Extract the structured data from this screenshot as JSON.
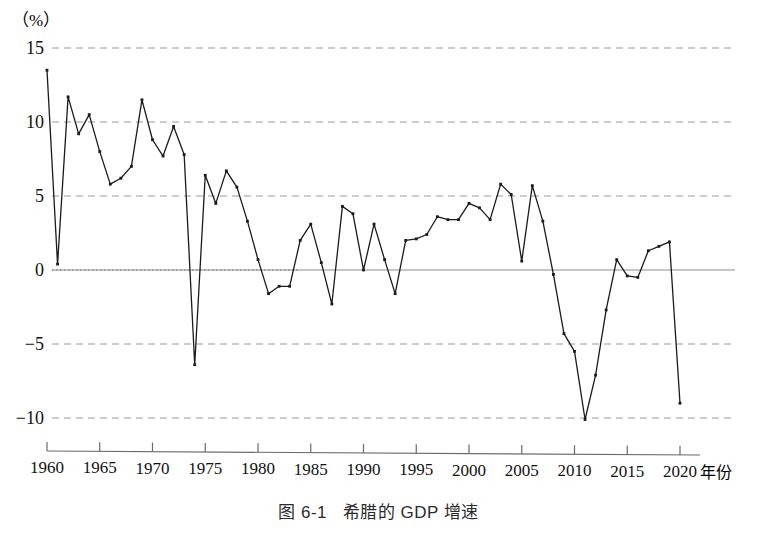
{
  "figure": {
    "caption_number": "图 6-1",
    "caption_title": "希腊的 GDP 增速",
    "unit_label": "（%）",
    "x_axis_name": "年份"
  },
  "chart_data": {
    "type": "line",
    "title": "希腊的 GDP 增速",
    "xlabel": "年份",
    "ylabel": "（%）",
    "xlim": [
      1959,
      2021
    ],
    "ylim": [
      -12,
      15
    ],
    "grid": true,
    "grid_values": [
      15,
      10,
      5,
      0,
      -5,
      -10
    ],
    "legend": "none",
    "y_ticks": [
      "15",
      "10",
      "5",
      "0",
      "−5",
      "−10"
    ],
    "y_tick_values": [
      15,
      10,
      5,
      0,
      -5,
      -10
    ],
    "x_ticks": [
      "1960",
      "1965",
      "1970",
      "1975",
      "1980",
      "1985",
      "1990",
      "1995",
      "2000",
      "2005",
      "2010",
      "2015",
      "2020"
    ],
    "x_tick_values": [
      1960,
      1965,
      1970,
      1975,
      1980,
      1985,
      1990,
      1995,
      2000,
      2005,
      2010,
      2015,
      2020
    ],
    "series": [
      {
        "name": "希腊 GDP 增速",
        "marker": "dot",
        "color": "#1a1a1a",
        "x": [
          1960,
          1961,
          1962,
          1963,
          1964,
          1965,
          1966,
          1967,
          1968,
          1969,
          1970,
          1971,
          1972,
          1973,
          1974,
          1975,
          1976,
          1977,
          1978,
          1979,
          1980,
          1981,
          1982,
          1983,
          1984,
          1985,
          1986,
          1987,
          1988,
          1989,
          1990,
          1991,
          1992,
          1993,
          1994,
          1995,
          1996,
          1997,
          1998,
          1999,
          2000,
          2001,
          2002,
          2003,
          2004,
          2005,
          2006,
          2007,
          2008,
          2009,
          2010,
          2011,
          2012,
          2013,
          2014,
          2015,
          2016,
          2017,
          2018,
          2019,
          2020
        ],
        "y": [
          13.5,
          0.4,
          11.7,
          9.2,
          10.5,
          8.0,
          5.8,
          6.2,
          7.0,
          11.5,
          8.8,
          7.7,
          9.7,
          7.8,
          -6.4,
          6.4,
          4.5,
          6.7,
          5.6,
          3.3,
          0.7,
          -1.6,
          -1.1,
          -1.1,
          2.0,
          3.1,
          0.5,
          -2.3,
          4.3,
          3.8,
          0.0,
          3.1,
          0.7,
          -1.6,
          2.0,
          2.1,
          2.4,
          3.6,
          3.4,
          3.4,
          4.5,
          4.2,
          3.4,
          5.8,
          5.1,
          0.6,
          5.7,
          3.3,
          -0.3,
          -4.3,
          -5.5,
          -10.1,
          -7.1,
          -2.7,
          0.7,
          -0.4,
          -0.5,
          1.3,
          1.6,
          1.9,
          -9.0
        ]
      }
    ]
  }
}
